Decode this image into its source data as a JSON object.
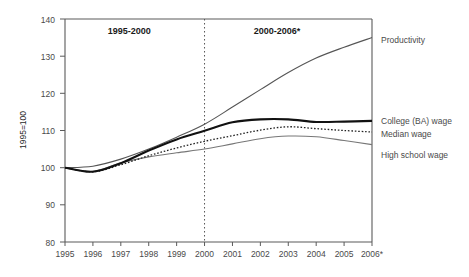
{
  "chart_data": {
    "type": "line",
    "title": "",
    "xlabel": "",
    "ylabel": "1995=100",
    "ylim": [
      80,
      140
    ],
    "yticks": [
      80,
      90,
      100,
      110,
      120,
      130,
      140
    ],
    "grid": false,
    "legend_position": "right",
    "categories": [
      "1995",
      "1996",
      "1997",
      "1998",
      "1999",
      "2000",
      "2001",
      "2002",
      "2003",
      "2004",
      "2005",
      "2006*"
    ],
    "x": [
      1995,
      1996,
      1997,
      1998,
      1999,
      2000,
      2001,
      2002,
      2003,
      2004,
      2005,
      2006
    ],
    "series": [
      {
        "name": "Productivity",
        "style": "thin-solid",
        "color": "#555555",
        "values": [
          100.0,
          100.4,
          102.3,
          105.0,
          108.2,
          111.7,
          116.3,
          121.0,
          125.6,
          129.5,
          132.4,
          135.0
        ]
      },
      {
        "name": "College (BA) wage",
        "style": "thick-solid",
        "color": "#111111",
        "values": [
          100.0,
          98.9,
          101.2,
          104.6,
          107.6,
          109.9,
          112.2,
          113.0,
          113.0,
          112.3,
          112.4,
          112.6
        ]
      },
      {
        "name": "Median wage",
        "style": "dotted",
        "color": "#222222",
        "values": [
          100.0,
          98.9,
          100.8,
          103.2,
          105.3,
          107.1,
          108.6,
          110.1,
          111.0,
          110.5,
          110.0,
          109.6
        ]
      },
      {
        "name": "High school wage",
        "style": "thin-solid-gray",
        "color": "#777777",
        "values": [
          100.0,
          99.0,
          101.3,
          102.9,
          104.0,
          105.0,
          106.4,
          107.8,
          108.5,
          108.3,
          107.3,
          106.2
        ]
      }
    ],
    "annotations": [
      {
        "name": "period-left",
        "text": "1995-2000",
        "x": 1997.3,
        "y": 136.0
      },
      {
        "name": "period-right",
        "text": "2000-2006*",
        "x": 2002.6,
        "y": 136.0
      }
    ],
    "divider": {
      "name": "period-divider",
      "x": 2000,
      "style": "dotted"
    }
  },
  "legend": {
    "items": [
      {
        "label": "Productivity",
        "y": 40
      },
      {
        "label": "College (BA) wage",
        "y": 121
      },
      {
        "label": "Median wage",
        "y": 134
      },
      {
        "label": "High school wage",
        "y": 155
      }
    ]
  },
  "axis": {
    "y_label": "1995=100",
    "y_tick_labels": [
      "140",
      "130",
      "120",
      "110",
      "100",
      "90",
      "80"
    ],
    "x_tick_labels": [
      "1995",
      "1996",
      "1997",
      "1998",
      "1999",
      "2000",
      "2001",
      "2002",
      "2003",
      "2004",
      "2005",
      "2006*"
    ]
  },
  "periods": {
    "left": "1995-2000",
    "right": "2000-2006*"
  },
  "colors": {
    "axis": "#5a5a5a",
    "productivity": "#555555",
    "college": "#111111",
    "median": "#222222",
    "highschool": "#777777",
    "text": "#4a4a4a",
    "background": "#ffffff"
  }
}
